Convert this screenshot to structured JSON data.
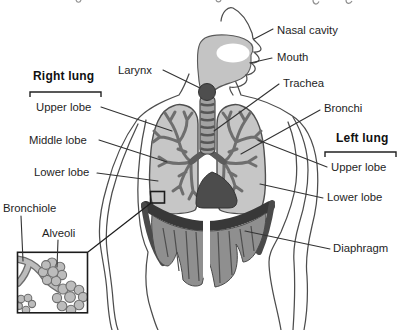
{
  "figure": {
    "labels": {
      "nasal_cavity": "Nasal cavity",
      "mouth": "Mouth",
      "larynx": "Larynx",
      "trachea": "Trachea",
      "bronchi": "Bronchi",
      "bronchiole": "Bronchiole",
      "alveoli": "Alveoli",
      "diaphragm": "Diaphragm"
    },
    "right_lung": {
      "title": "Right lung",
      "lobes": [
        "Upper lobe",
        "Middle lobe",
        "Lower lobe"
      ]
    },
    "left_lung": {
      "title": "Left lung",
      "lobes": [
        "Upper lobe",
        "Lower lobe"
      ]
    },
    "colors": {
      "background": "#ffffff",
      "lung_fill": "#c6c6c6",
      "bronchial_tree": "#6e6e6e",
      "trachea_fill": "#a2a2a2",
      "larynx_fill": "#4e4e4e",
      "heart_fill": "#4c4c4c",
      "dark_band": "#383838",
      "diaphragm_fill": "#8f8f8f",
      "alveoli_fill": "#bcbcbc",
      "outline": "#4d4d4d",
      "leader_line": "#333333",
      "label_text": "#1e1e1e"
    }
  }
}
